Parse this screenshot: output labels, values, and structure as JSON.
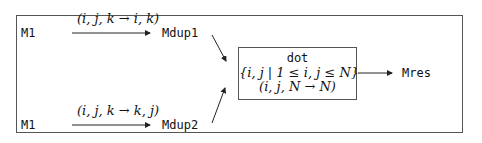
{
  "diagram": {
    "top_row": {
      "source": "M1",
      "mapping": "(i, j, k → i, k)",
      "target": "Mdup1"
    },
    "bottom_row": {
      "source": "M1",
      "mapping": "(i, j, k → k, j)",
      "target": "Mdup2"
    },
    "operation": {
      "name": "dot",
      "domain": "{i, j | 1 ≤ i, j ≤ N}",
      "mapping": "(i, j, N → N)"
    },
    "output": "Mres"
  }
}
